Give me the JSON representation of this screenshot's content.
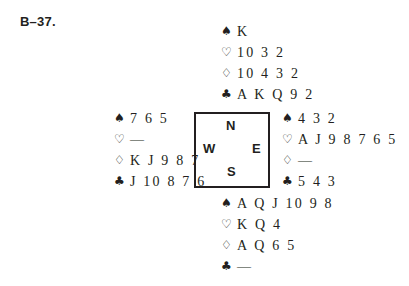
{
  "problem_label": "B–37.",
  "suit_symbols": {
    "spades": "♠",
    "hearts": "♡",
    "diamonds": "♢",
    "clubs": "♣"
  },
  "compass": {
    "north": "N",
    "west": "W",
    "east": "E",
    "south": "S"
  },
  "hands": {
    "north": {
      "spades": "K",
      "hearts": "10 3 2",
      "diamonds": "10 4 3 2",
      "clubs": "A K Q 9 2"
    },
    "west": {
      "spades": "7 6 5",
      "hearts": "—",
      "diamonds": "K J 9 8 7",
      "clubs": "J 10 8 7 6"
    },
    "east": {
      "spades": "4 3 2",
      "hearts": "A J 9 8 7 6 5",
      "diamonds": "—",
      "clubs": "5 4 3"
    },
    "south": {
      "spades": "A Q J 10 9 8",
      "hearts": "K Q 4",
      "diamonds": "A Q 6 5",
      "clubs": "—"
    }
  }
}
